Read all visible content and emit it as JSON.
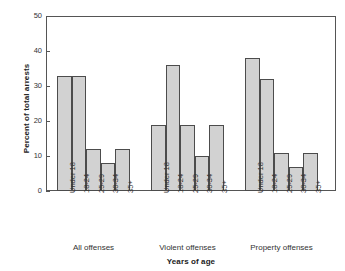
{
  "chart_data": {
    "type": "bar",
    "title": "",
    "xlabel": "Years of age",
    "ylabel": "Percent of total arrests",
    "ylim": [
      0,
      50
    ],
    "yticks": [
      0,
      10,
      20,
      30,
      40,
      50
    ],
    "grid": false,
    "legend": "none",
    "categories": [
      "Under 18",
      "18-24",
      "25-29",
      "30-34",
      "35+"
    ],
    "groups": [
      "All offenses",
      "Violent offenses",
      "Property offenses"
    ],
    "series": [
      {
        "name": "All offenses",
        "values": [
          33,
          33,
          12,
          8,
          12
        ]
      },
      {
        "name": "Violent offenses",
        "values": [
          19,
          36,
          19,
          10,
          19
        ]
      },
      {
        "name": "Property offenses",
        "values": [
          38,
          32,
          11,
          7,
          11
        ]
      }
    ],
    "bar_color": "#d2d2d2",
    "bar_edge_color": "#4c4c4c",
    "axis_color": "#555555"
  },
  "axis": {
    "y_title": "Percent of total arrests",
    "x_title": "Years of age",
    "y_tick_labels": [
      "0",
      "10",
      "20",
      "30",
      "40",
      "50"
    ]
  }
}
